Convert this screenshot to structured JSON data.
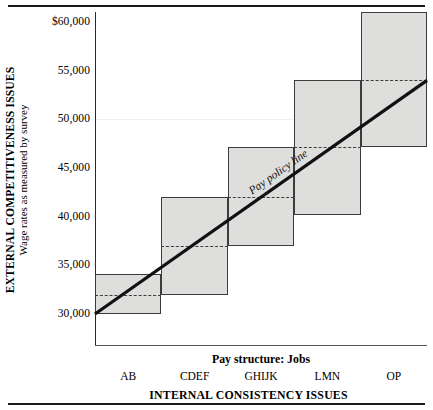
{
  "figure": {
    "y_axis_title_main": "EXTERNAL COMPETITIVENESS ISSUES",
    "y_axis_title_sub": "Wage rates as measured by survey",
    "x_axis_title": "INTERNAL CONSISTENCY ISSUES",
    "x_axis_subtitle": "Pay structure: Jobs",
    "policy_line_label": "Pay policy line"
  },
  "chart_data": {
    "type": "bar",
    "title": "",
    "subtitle": "",
    "xlabel": "INTERNAL CONSISTENCY ISSUES",
    "ylabel": "EXTERNAL COMPETITIVENESS ISSUES",
    "ylabel_secondary": "Wage rates as measured by survey",
    "categories": [
      "AB",
      "CDEF",
      "GHIJK",
      "LMN",
      "OP"
    ],
    "ylim": [
      28000,
      61500
    ],
    "ytick_labels": [
      "$60,000",
      "55,000",
      "50,000",
      "45,000",
      "40,000",
      "35,000",
      "30,000"
    ],
    "ytick_values": [
      60000,
      55000,
      50000,
      45000,
      40000,
      35000,
      30000
    ],
    "grid": false,
    "legend": "none",
    "ranges": [
      {
        "label": "AB",
        "min": 30000,
        "max": 34100,
        "midpoint": 32000
      },
      {
        "label": "CDEF",
        "min": 32000,
        "max": 42000,
        "midpoint": 37000
      },
      {
        "label": "GHIJK",
        "min": 37000,
        "max": 47200,
        "midpoint": 42000
      },
      {
        "label": "LMN",
        "min": 40200,
        "max": 54000,
        "midpoint": 47200
      },
      {
        "label": "OP",
        "min": 47200,
        "max": 61000,
        "midpoint": 54000
      }
    ],
    "policy_line": {
      "name": "Pay policy line",
      "x": [
        "AB",
        "OP"
      ],
      "y": [
        30000,
        54000
      ],
      "annotation": "Pay policy line"
    }
  }
}
